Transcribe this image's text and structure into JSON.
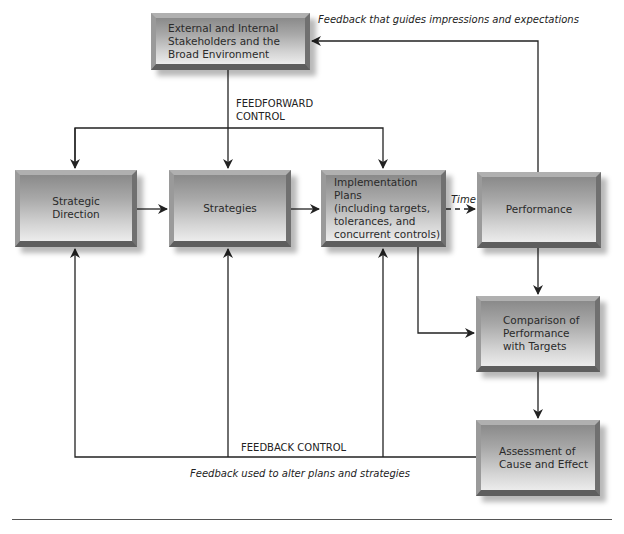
{
  "diagram": {
    "nodes": {
      "stakeholders": "External and Internal\nStakeholders and the\nBroad Environment",
      "strategic_direction": "Strategic\nDirection",
      "strategies": "Strategies",
      "implementation": "Implementation Plans\n(including targets,\ntolerances, and\nconcurrent controls)",
      "performance": "Performance",
      "comparison": "Comparison of\nPerformance\nwith Targets",
      "assessment": "Assessment of\nCause and Effect"
    },
    "labels": {
      "feedforward": "FEEDFORWARD\nCONTROL",
      "feedback_control": "FEEDBACK CONTROL",
      "time": "Time",
      "feedback_top": "Feedback that guides impressions and expectations",
      "feedback_bottom": "Feedback used to alter plans and strategies"
    },
    "colors": {
      "line": "#222222",
      "box_dark": "#8a8a8a",
      "box_light": "#ececec"
    }
  }
}
